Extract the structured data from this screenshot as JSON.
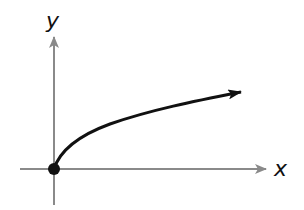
{
  "diagram": {
    "type": "function-graph",
    "function": "square root (y = sqrt(x)) starting at origin",
    "axes": {
      "x_label": "x",
      "y_label": "y",
      "axis_color": "#8a8a8a"
    },
    "curve": {
      "color": "#111111",
      "start_point": "origin (closed dot)",
      "direction": "increasing to the right, arrow at end"
    },
    "origin_marker": {
      "style": "filled-circle",
      "color": "#111111"
    }
  }
}
